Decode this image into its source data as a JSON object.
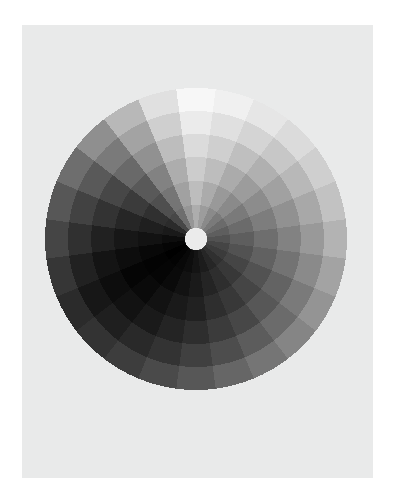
{
  "figure": {
    "title": "",
    "background_color": "#ffffff",
    "panel_color": "#e9eaea",
    "panel": {
      "x": 22,
      "y": 25,
      "width": 351,
      "height": 453
    }
  },
  "chart_data": {
    "type": "heatmap",
    "subtype": "polar-sunburst-grayscale",
    "title": "",
    "subtitle": "",
    "xlabel": "",
    "ylabel": "",
    "legend": [],
    "annotations": [],
    "grid": false,
    "axes_visible": false,
    "tick_labels": [],
    "colormap": "gray",
    "color_scale": {
      "min": 0.0,
      "max": 1.0,
      "min_color": "#000000",
      "max_color": "#ffffff"
    },
    "geometry": {
      "center_x": 196,
      "center_y": 239,
      "outer_radius": 151,
      "inner_radius": 11,
      "n_sectors": 24,
      "n_rings": 6,
      "sector_angle_deg": 15,
      "start_angle_deg": -90,
      "direction": "clockwise",
      "hole_color": "#ebebeb"
    },
    "ring_radii": [
      11,
      34,
      58,
      82,
      105,
      128,
      151
    ],
    "sector_start_angles_deg": [
      -97.5,
      -82.5,
      -67.5,
      -52.5,
      -37.5,
      -22.5,
      -7.5,
      7.5,
      22.5,
      37.5,
      52.5,
      67.5,
      82.5,
      97.5,
      112.5,
      127.5,
      142.5,
      157.5,
      172.5,
      187.5,
      202.5,
      217.5,
      232.5,
      247.5
    ],
    "sector_labels": [
      "S1",
      "S2",
      "S3",
      "S4",
      "S5",
      "S6",
      "S7",
      "S8",
      "S9",
      "S10",
      "S11",
      "S12",
      "S13",
      "S14",
      "S15",
      "S16",
      "S17",
      "S18",
      "S19",
      "S20",
      "S21",
      "S22",
      "S23",
      "S24"
    ],
    "ring_labels": [
      "R1",
      "R2",
      "R3",
      "R4",
      "R5",
      "R6"
    ],
    "values": [
      [
        0.97,
        0.92,
        0.86,
        0.8,
        0.74,
        0.68
      ],
      [
        0.94,
        0.88,
        0.81,
        0.74,
        0.67,
        0.61
      ],
      [
        0.9,
        0.83,
        0.75,
        0.67,
        0.6,
        0.54
      ],
      [
        0.86,
        0.78,
        0.69,
        0.61,
        0.54,
        0.48
      ],
      [
        0.81,
        0.72,
        0.63,
        0.55,
        0.48,
        0.42
      ],
      [
        0.76,
        0.66,
        0.57,
        0.49,
        0.42,
        0.37
      ],
      [
        0.7,
        0.6,
        0.51,
        0.43,
        0.37,
        0.32
      ],
      [
        0.64,
        0.54,
        0.45,
        0.38,
        0.32,
        0.27
      ],
      [
        0.58,
        0.48,
        0.39,
        0.32,
        0.27,
        0.23
      ],
      [
        0.52,
        0.42,
        0.34,
        0.27,
        0.22,
        0.19
      ],
      [
        0.46,
        0.36,
        0.28,
        0.22,
        0.18,
        0.15
      ],
      [
        0.4,
        0.3,
        0.23,
        0.18,
        0.14,
        0.11
      ],
      [
        0.34,
        0.25,
        0.18,
        0.13,
        0.1,
        0.08
      ],
      [
        0.29,
        0.2,
        0.14,
        0.1,
        0.07,
        0.05
      ],
      [
        0.24,
        0.16,
        0.1,
        0.07,
        0.04,
        0.03
      ],
      [
        0.2,
        0.12,
        0.07,
        0.04,
        0.02,
        0.01
      ],
      [
        0.17,
        0.09,
        0.05,
        0.02,
        0.01,
        0.0
      ],
      [
        0.21,
        0.13,
        0.08,
        0.05,
        0.03,
        0.02
      ],
      [
        0.27,
        0.19,
        0.13,
        0.09,
        0.07,
        0.05
      ],
      [
        0.34,
        0.26,
        0.2,
        0.15,
        0.12,
        0.1
      ],
      [
        0.43,
        0.35,
        0.28,
        0.23,
        0.19,
        0.17
      ],
      [
        0.56,
        0.48,
        0.41,
        0.35,
        0.31,
        0.28
      ],
      [
        0.72,
        0.64,
        0.57,
        0.51,
        0.46,
        0.43
      ],
      [
        0.88,
        0.81,
        0.74,
        0.68,
        0.63,
        0.59
      ]
    ]
  }
}
